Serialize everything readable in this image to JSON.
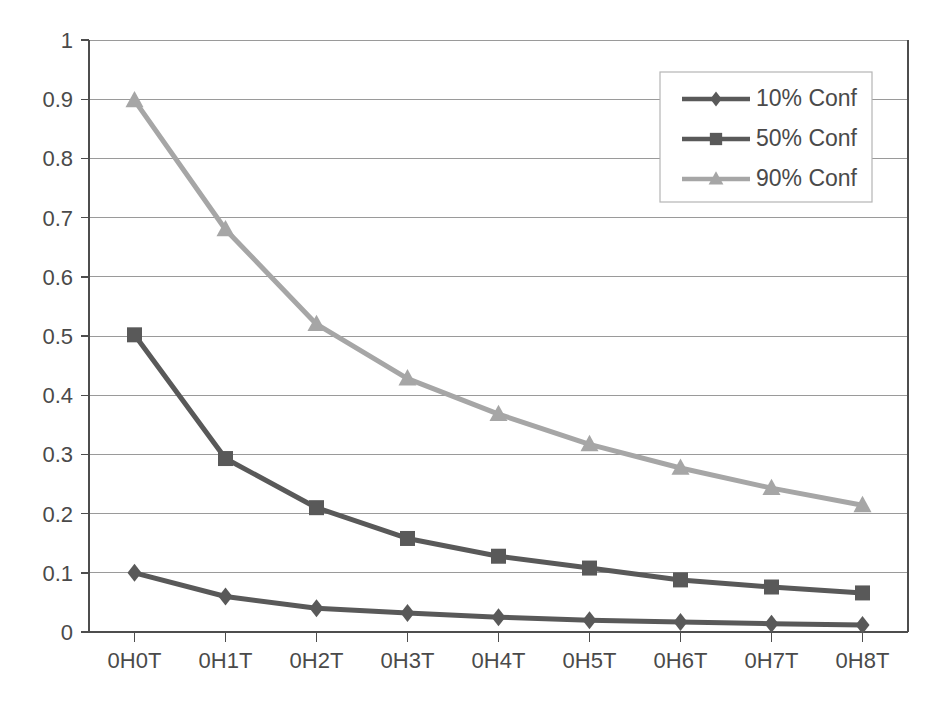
{
  "chart_data": {
    "type": "line",
    "title": "",
    "subtitle": "",
    "xlabel": "",
    "ylabel": "",
    "categories": [
      "0H0T",
      "0H1T",
      "0H2T",
      "0H3T",
      "0H4T",
      "0H5T",
      "0H6T",
      "0H7T",
      "0H8T"
    ],
    "ylim": [
      0,
      1
    ],
    "ytick_labels": [
      "0",
      "0.1",
      "0.2",
      "0.3",
      "0.4",
      "0.5",
      "0.6",
      "0.7",
      "0.8",
      "0.9",
      "1"
    ],
    "ytick_values": [
      0,
      0.1,
      0.2,
      0.3,
      0.4,
      0.5,
      0.6,
      0.7,
      0.8,
      0.9,
      1
    ],
    "grid": true,
    "grid_axis": "y",
    "legend_position": "top-right",
    "series": [
      {
        "name": "10% Conf",
        "marker": "diamond",
        "color": "#595959",
        "values": [
          0.1,
          0.06,
          0.04,
          0.032,
          0.025,
          0.02,
          0.017,
          0.014,
          0.012
        ]
      },
      {
        "name": "50% Conf",
        "marker": "square",
        "color": "#595959",
        "values": [
          0.502,
          0.293,
          0.21,
          0.158,
          0.128,
          0.108,
          0.088,
          0.076,
          0.066
        ]
      },
      {
        "name": "90% Conf",
        "marker": "triangle",
        "color": "#A6A6A6",
        "values": [
          0.898,
          0.68,
          0.52,
          0.428,
          0.368,
          0.317,
          0.277,
          0.243,
          0.214
        ]
      }
    ]
  },
  "legend": {
    "entries": [
      {
        "label": "10% Conf"
      },
      {
        "label": "50% Conf"
      },
      {
        "label": "90% Conf"
      }
    ]
  },
  "colors": {
    "series_dark": "#595959",
    "series_light": "#A6A6A6",
    "axis": "#4d4d4d",
    "grid": "#9a9a9a",
    "text": "#4a4a4a",
    "background": "#ffffff"
  }
}
